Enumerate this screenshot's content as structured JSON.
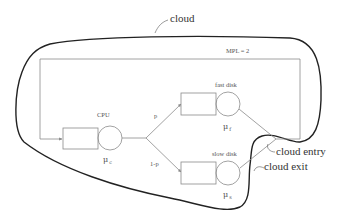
{
  "diagram": {
    "title_label": "cloud",
    "mpl_label": "MPL = 2",
    "nodes": {
      "cpu": {
        "label": "CPU",
        "rate_symbol": "μ",
        "rate_sub": "c"
      },
      "fast_disk": {
        "label": "fast disk",
        "rate_symbol": "μ",
        "rate_sub": "f"
      },
      "slow_disk": {
        "label": "slow disk",
        "rate_symbol": "μ",
        "rate_sub": "s"
      }
    },
    "branches": {
      "upper": "p",
      "lower": "1-p"
    },
    "annotations": {
      "cloud_entry": "cloud entry",
      "cloud_exit": "cloud exit"
    },
    "colors": {
      "network_lines": "#8a8a8a",
      "cloud_outline": "#222222",
      "text": "#555555"
    }
  }
}
